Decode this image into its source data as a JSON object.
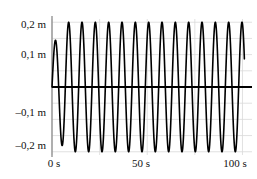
{
  "chart_data": {
    "type": "line",
    "title": "",
    "subtitle": "",
    "xlabel": "",
    "ylabel": "",
    "grid": true,
    "legend": false,
    "legend_position": "none",
    "xlim": [
      0,
      105
    ],
    "ylim": [
      -0.21,
      0.21
    ],
    "x_unit": "s",
    "y_unit": "m",
    "decimal_separator": ",",
    "x_ticks": [
      {
        "value": 0,
        "label": "0 s"
      },
      {
        "value": 50,
        "label": "50 s"
      },
      {
        "value": 100,
        "label": "100 s"
      }
    ],
    "y_ticks": [
      {
        "value": 0.2,
        "label": "0,2 m"
      },
      {
        "value": 0.1,
        "label": "0,1 m"
      },
      {
        "value": -0.1,
        "label": "–0,1 m"
      },
      {
        "value": -0.2,
        "label": "–0,2 m"
      }
    ],
    "x_gridlines": [
      0,
      25,
      50,
      75,
      100
    ],
    "y_gridlines": [
      0.2,
      0.15,
      0.1,
      0.05,
      -0.05,
      -0.1,
      -0.15,
      -0.2
    ],
    "zero_line": 0,
    "series": [
      {
        "name": "displacement",
        "color": "#000000",
        "line_width": 1.6,
        "description": "Sinusoidal oscillation starting at zero, first crest reduced to about 0,13 m, then steady amplitude of 0,20 m",
        "waveform": {
          "steady_amplitude": 0.2,
          "first_peak_amplitude": 0.13,
          "period": 7.0,
          "phase_offset": 0,
          "start_time": 0,
          "end_time": 101,
          "cycles": 14.4,
          "end_value": -0.14,
          "envelope": "rises from 0 at t=0 to full amplitude within the first cycle"
        },
        "points": [
          {
            "t": 0,
            "y": 0.0
          },
          {
            "t": 1.75,
            "y": 0.13
          },
          {
            "t": 3.5,
            "y": 0.0
          },
          {
            "t": 5.25,
            "y": -0.19
          },
          {
            "t": 7.0,
            "y": 0.0
          },
          {
            "t": 8.75,
            "y": 0.2
          },
          {
            "t": 10.5,
            "y": 0.0
          },
          {
            "t": 12.25,
            "y": -0.2
          },
          {
            "t": 14.0,
            "y": 0.0
          },
          {
            "t": 15.75,
            "y": 0.2
          },
          {
            "t": 17.5,
            "y": 0.0
          },
          {
            "t": 19.25,
            "y": -0.2
          },
          {
            "t": 21.0,
            "y": 0.0
          },
          {
            "t": 22.75,
            "y": 0.2
          },
          {
            "t": 24.5,
            "y": 0.0
          },
          {
            "t": 26.25,
            "y": -0.2
          },
          {
            "t": 28.0,
            "y": 0.0
          },
          {
            "t": 29.75,
            "y": 0.2
          },
          {
            "t": 31.5,
            "y": 0.0
          },
          {
            "t": 33.25,
            "y": -0.2
          },
          {
            "t": 35.0,
            "y": 0.0
          },
          {
            "t": 36.75,
            "y": 0.2
          },
          {
            "t": 38.5,
            "y": 0.0
          },
          {
            "t": 40.25,
            "y": -0.2
          },
          {
            "t": 42.0,
            "y": 0.0
          },
          {
            "t": 43.75,
            "y": 0.2
          },
          {
            "t": 45.5,
            "y": 0.0
          },
          {
            "t": 47.25,
            "y": -0.2
          },
          {
            "t": 49.0,
            "y": 0.0
          },
          {
            "t": 50.75,
            "y": 0.2
          },
          {
            "t": 52.5,
            "y": 0.0
          },
          {
            "t": 54.25,
            "y": -0.2
          },
          {
            "t": 56.0,
            "y": 0.0
          },
          {
            "t": 57.75,
            "y": 0.2
          },
          {
            "t": 59.5,
            "y": 0.0
          },
          {
            "t": 61.25,
            "y": -0.2
          },
          {
            "t": 63.0,
            "y": 0.0
          },
          {
            "t": 64.75,
            "y": 0.2
          },
          {
            "t": 66.5,
            "y": 0.0
          },
          {
            "t": 68.25,
            "y": -0.2
          },
          {
            "t": 70.0,
            "y": 0.0
          },
          {
            "t": 71.75,
            "y": 0.2
          },
          {
            "t": 73.5,
            "y": 0.0
          },
          {
            "t": 75.25,
            "y": -0.2
          },
          {
            "t": 77.0,
            "y": 0.0
          },
          {
            "t": 78.75,
            "y": 0.2
          },
          {
            "t": 80.5,
            "y": 0.0
          },
          {
            "t": 82.25,
            "y": -0.2
          },
          {
            "t": 84.0,
            "y": 0.0
          },
          {
            "t": 85.75,
            "y": 0.2
          },
          {
            "t": 87.5,
            "y": 0.0
          },
          {
            "t": 89.25,
            "y": -0.2
          },
          {
            "t": 91.0,
            "y": 0.0
          },
          {
            "t": 92.75,
            "y": 0.2
          },
          {
            "t": 94.5,
            "y": 0.0
          },
          {
            "t": 96.25,
            "y": -0.2
          },
          {
            "t": 98.0,
            "y": 0.0
          },
          {
            "t": 99.75,
            "y": 0.2
          },
          {
            "t": 101.0,
            "y": -0.14
          }
        ]
      }
    ],
    "colors": {
      "curve": "#000000",
      "zero_line": "#000000",
      "axis": "#8c8c8c",
      "grid": "#d9d9d9",
      "background": "#ffffff",
      "text": "#111111"
    }
  }
}
